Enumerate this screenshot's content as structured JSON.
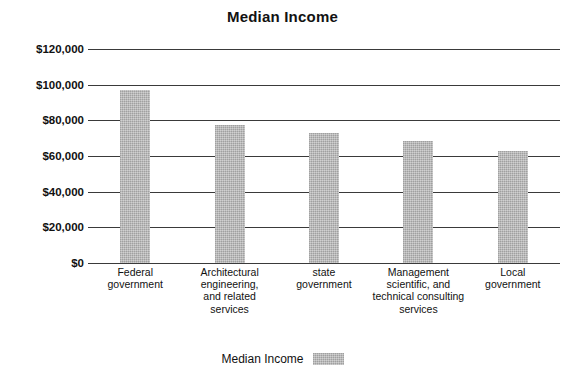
{
  "chart_data": {
    "type": "bar",
    "title": "Median Income",
    "xlabel": "",
    "ylabel": "",
    "ylim": [
      0,
      120000
    ],
    "ytick_labels": [
      "$120,000",
      "$100,000",
      "$80,000",
      "$60,000",
      "$40,000",
      "$20,000",
      "$0"
    ],
    "ytick_values": [
      120000,
      100000,
      80000,
      60000,
      40000,
      20000,
      0
    ],
    "grid": true,
    "legend_position": "bottom",
    "categories": [
      "Federal government",
      "Architectural engineering, and related services",
      "state government",
      "Management scientific, and technical consulting services",
      "Local government"
    ],
    "category_lines": [
      [
        "Federal",
        "government"
      ],
      [
        "Architectural",
        "engineering,",
        "and related",
        "services"
      ],
      [
        "state",
        "government"
      ],
      [
        "Management",
        "scientific, and",
        "technical consulting",
        "services"
      ],
      [
        "Local",
        "government"
      ]
    ],
    "series": [
      {
        "name": "Median Income",
        "color": "#b6b6b6",
        "values": [
          97000,
          77500,
          73000,
          68500,
          63000
        ]
      }
    ]
  },
  "legend": {
    "label": "Median Income",
    "swatch_color": "#b6b6b6"
  }
}
